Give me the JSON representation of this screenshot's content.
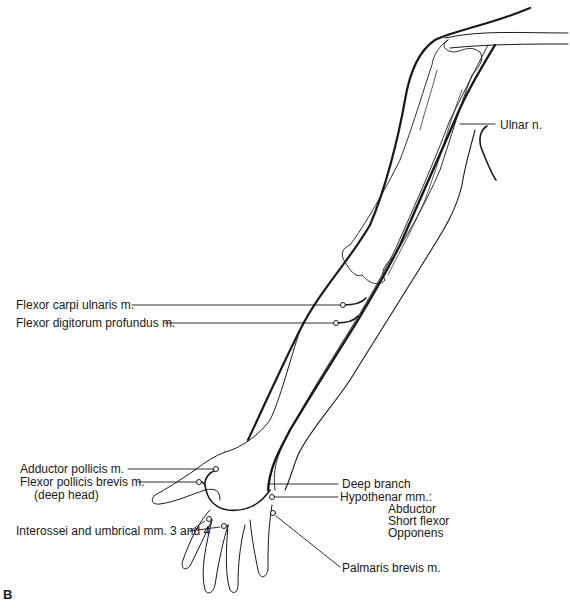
{
  "figure": {
    "panel_letter": "B",
    "nerve": {
      "label": "Ulnar n."
    },
    "labels": {
      "flexor_carpi_ulnaris": "Flexor carpi ulnaris m.",
      "flexor_digitorum_profundus": "Flexor digitorum profundus m.",
      "adductor_pollicis": "Adductor pollicis m.",
      "flexor_pollicis_brevis": "Flexor pollicis brevis m.",
      "flexor_pollicis_brevis_sub": "(deep head)",
      "interossei": "Interossei and umbrical mm. 3 and 4",
      "deep_branch": "Deep branch",
      "hypothenar": "Hypothenar mm.:",
      "hypothenar_items": [
        "Abductor",
        "Short flexor",
        "Opponens"
      ],
      "palmaris_brevis": "Palmaris brevis m."
    },
    "colors": {
      "line": "#1a1a1a",
      "background": "#ffffff"
    }
  }
}
